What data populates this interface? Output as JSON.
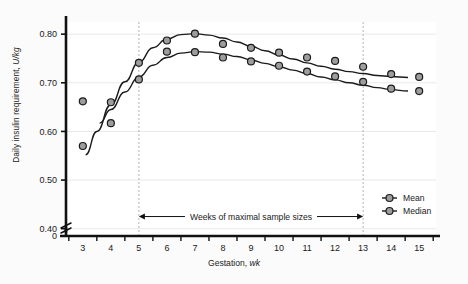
{
  "chart_data": {
    "type": "scatter",
    "title": "",
    "xlabel": "Gestation, wk",
    "ylabel": "Daily insulin requirement, U/kg",
    "xlim": [
      2.4,
      15.6
    ],
    "ylim": [
      0.385,
      0.825
    ],
    "grid": true,
    "legend_position": "bottom-right",
    "x_ticks": [
      3,
      4,
      5,
      6,
      7,
      8,
      9,
      10,
      11,
      12,
      13,
      14,
      15
    ],
    "x_tick_labels": [
      "3",
      "4",
      "5",
      "6",
      "7",
      "8",
      "9",
      "10",
      "11",
      "12",
      "13",
      "14",
      "15"
    ],
    "y_ticks": [
      0.4,
      0.5,
      0.6,
      0.7,
      0.8
    ],
    "y_tick_labels": [
      "0.40",
      "0.50",
      "0.60",
      "0.70",
      "0.80"
    ],
    "y_axis_break": true,
    "y_origin_label": "0",
    "x": [
      3,
      4,
      5,
      6,
      7,
      8,
      9,
      10,
      11,
      12,
      13,
      14,
      15
    ],
    "series": [
      {
        "name": "Mean",
        "marker": "circle",
        "values": [
          0.57,
          0.66,
          0.741,
          0.787,
          0.801,
          0.78,
          0.772,
          0.762,
          0.752,
          0.745,
          0.733,
          0.718,
          0.712
        ]
      },
      {
        "name": "Median",
        "marker": "circle",
        "values": [
          0.662,
          0.617,
          0.707,
          0.764,
          0.763,
          0.752,
          0.744,
          0.735,
          0.723,
          0.713,
          0.702,
          0.688,
          0.683
        ]
      }
    ],
    "fit_curves": [
      {
        "name": "Mean fit",
        "points": [
          [
            3.1,
            0.552
          ],
          [
            3.5,
            0.6
          ],
          [
            4.0,
            0.655
          ],
          [
            4.5,
            0.702
          ],
          [
            5.0,
            0.742
          ],
          [
            5.5,
            0.772
          ],
          [
            6.0,
            0.79
          ],
          [
            6.5,
            0.799
          ],
          [
            7.0,
            0.801
          ],
          [
            7.5,
            0.798
          ],
          [
            8.0,
            0.792
          ],
          [
            8.5,
            0.784
          ],
          [
            9.0,
            0.775
          ],
          [
            9.5,
            0.766
          ],
          [
            10.0,
            0.757
          ],
          [
            10.5,
            0.749
          ],
          [
            11.0,
            0.741
          ],
          [
            11.5,
            0.734
          ],
          [
            12.0,
            0.728
          ],
          [
            12.5,
            0.723
          ],
          [
            13.0,
            0.719
          ],
          [
            13.5,
            0.715
          ],
          [
            14.0,
            0.713
          ],
          [
            14.6,
            0.711
          ]
        ]
      },
      {
        "name": "Median fit",
        "points": [
          [
            3.6,
            0.617
          ],
          [
            4.0,
            0.645
          ],
          [
            4.5,
            0.681
          ],
          [
            5.0,
            0.712
          ],
          [
            5.5,
            0.736
          ],
          [
            6.0,
            0.752
          ],
          [
            6.5,
            0.761
          ],
          [
            7.0,
            0.764
          ],
          [
            7.5,
            0.763
          ],
          [
            8.0,
            0.759
          ],
          [
            8.5,
            0.754
          ],
          [
            9.0,
            0.747
          ],
          [
            9.5,
            0.74
          ],
          [
            10.0,
            0.733
          ],
          [
            10.5,
            0.726
          ],
          [
            11.0,
            0.719
          ],
          [
            11.5,
            0.712
          ],
          [
            12.0,
            0.706
          ],
          [
            12.5,
            0.7
          ],
          [
            13.0,
            0.695
          ],
          [
            13.5,
            0.69
          ],
          [
            14.0,
            0.686
          ],
          [
            14.6,
            0.683
          ]
        ]
      }
    ],
    "annotations": [
      {
        "name": "max-sample-range",
        "text": "Weeks of maximal sample sizes",
        "from_x": 5,
        "to_x": 13,
        "y": 0.425,
        "style": "double-arrow"
      }
    ],
    "reference_lines": [
      {
        "name": "week-5-dashed",
        "x": 5,
        "style": "dashed"
      },
      {
        "name": "week-13-dashed",
        "x": 13,
        "style": "dashed"
      }
    ],
    "colors": {
      "axis": "#111111",
      "curve": "#1b1b1b",
      "marker_fill": "#9d9d9d",
      "marker_edge": "#1b1b1b",
      "grid": "#e9e9e9",
      "dashed": "#b4b4b4",
      "background": "#ffffff",
      "figure_background": "#fbfbfb",
      "text": "#1a1a1a"
    }
  },
  "legend": {
    "items": [
      {
        "label": "Mean"
      },
      {
        "label": "Median"
      }
    ]
  }
}
